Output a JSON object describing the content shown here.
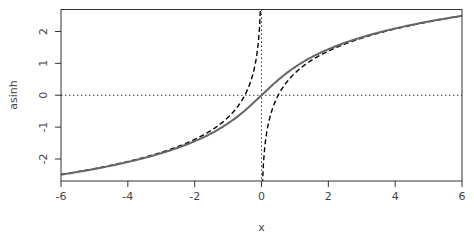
{
  "chart_data": {
    "type": "line",
    "title": "",
    "xlabel": "x",
    "ylabel": "asinh",
    "xlim": [
      -6,
      6
    ],
    "ylim": [
      -2.69,
      2.69
    ],
    "x_ticks": [
      "-6",
      "-4",
      "-2",
      "0",
      "2",
      "4",
      "6"
    ],
    "y_ticks": [
      "-2",
      "-1",
      "0",
      "1",
      "2"
    ],
    "grid": false,
    "legend": null,
    "reference_lines": [
      {
        "orientation": "horizontal",
        "value": 0,
        "style": "dotted"
      },
      {
        "orientation": "vertical",
        "value": 0,
        "style": "dotted"
      }
    ],
    "series": [
      {
        "name": "asinh(x)",
        "style": "solid",
        "color": "#666666",
        "x": [
          -6,
          -4,
          -2,
          -1,
          0,
          1,
          2,
          4,
          6
        ],
        "values": [
          -2.49,
          -2.09,
          -1.44,
          -0.88,
          0,
          0.88,
          1.44,
          2.09,
          2.49
        ]
      },
      {
        "name": "log approximation (x<0 branch)",
        "style": "dashed",
        "color": "#000000",
        "x": [
          -6,
          -4,
          -2,
          -1,
          -0.5,
          -0.2,
          -0.05
        ],
        "values": [
          -2.48,
          -2.08,
          -1.39,
          -0.69,
          0.0,
          0.92,
          2.3
        ]
      },
      {
        "name": "log approximation (x>0 branch)",
        "style": "dashed",
        "color": "#000000",
        "x": [
          0.05,
          0.2,
          0.5,
          1,
          2,
          4,
          6
        ],
        "values": [
          -2.3,
          -0.92,
          0.0,
          0.69,
          1.39,
          2.08,
          2.48
        ]
      }
    ]
  }
}
